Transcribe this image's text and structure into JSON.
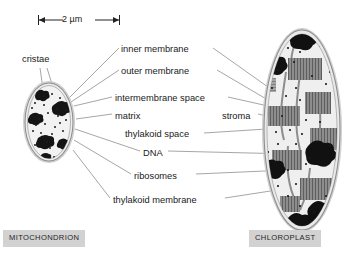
{
  "figure": {
    "kind": "biology-diagram",
    "scale_bar": {
      "text": "2 µm",
      "x1": 38,
      "x2": 120,
      "y": 20
    }
  },
  "labels": [
    {
      "id": "cristae",
      "text": "cristae",
      "x": 22,
      "y": 55,
      "align": "left"
    },
    {
      "id": "inner-membrane",
      "text": "inner membrane",
      "x": 121,
      "y": 45,
      "align": "left"
    },
    {
      "id": "outer-membrane",
      "text": "outer membrane",
      "x": 121,
      "y": 67,
      "align": "left"
    },
    {
      "id": "intermembrane-space",
      "text": "intermembrane space",
      "x": 115,
      "y": 94,
      "align": "left"
    },
    {
      "id": "matrix",
      "text": "matrix",
      "x": 115,
      "y": 112,
      "align": "left"
    },
    {
      "id": "stroma",
      "text": "stroma",
      "x": 222,
      "y": 112,
      "align": "left"
    },
    {
      "id": "thylakoid-space",
      "text": "thylakoid space",
      "x": 125,
      "y": 130,
      "align": "left"
    },
    {
      "id": "dna",
      "text": "DNA",
      "x": 143,
      "y": 149,
      "align": "left"
    },
    {
      "id": "ribosomes",
      "text": "ribosomes",
      "x": 134,
      "y": 172,
      "align": "left"
    },
    {
      "id": "thylakoid-membrane",
      "text": "thylakoid membrane",
      "x": 113,
      "y": 196,
      "align": "left"
    }
  ],
  "captions": [
    {
      "id": "mitochondrion",
      "text": "MITOCHONDRION",
      "x": 3,
      "y": 230
    },
    {
      "id": "chloroplast",
      "text": "CHLOROPLAST",
      "x": 249,
      "y": 230
    }
  ],
  "organelles": [
    {
      "id": "mitochondrion",
      "shape": "ellipse",
      "cx": 49,
      "cy": 122,
      "rx": 24,
      "ry": 39
    },
    {
      "id": "chloroplast",
      "shape": "ellipse",
      "cx": 302,
      "cy": 130,
      "rx": 38,
      "ry": 100
    }
  ],
  "colors": {
    "membrane_outline": "#707070",
    "membrane_halo": "#d8d8d8",
    "cytosol_fill": "#efefef",
    "stroma_fill": "#ececec",
    "granum_gray": "#8d8d8d",
    "granum_stripe": "#5a5a5a",
    "dna_black": "#111111",
    "ribosome_dot": "#1a1a1a",
    "leader_line": "#8a8a8a",
    "caption_bg": "#d2d2d2",
    "text": "#1a1a1a"
  }
}
